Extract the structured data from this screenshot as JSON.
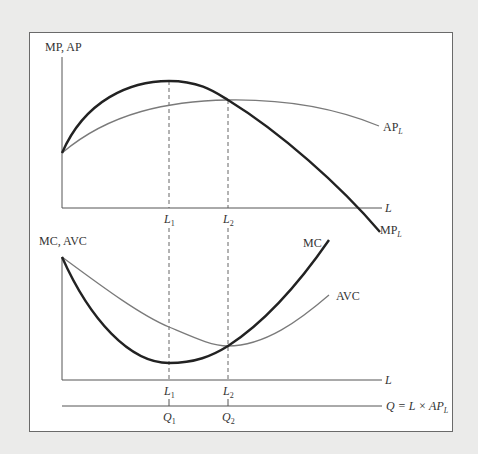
{
  "top_panel": {
    "y_axis_label": "MP, AP",
    "x_axis_label": "L",
    "curves": {
      "mp": {
        "label": "MP",
        "subscript": "L"
      },
      "ap": {
        "label": "AP",
        "subscript": "L"
      }
    },
    "ticks": [
      {
        "label": "L",
        "subscript": "1"
      },
      {
        "label": "L",
        "subscript": "2"
      }
    ]
  },
  "bottom_panel": {
    "y_axis_label": "MC, AVC",
    "x_axis_label": "L",
    "q_axis_label": "Q = L × AP",
    "q_axis_subscript": "L",
    "curves": {
      "mc": {
        "label": "MC"
      },
      "avc": {
        "label": "AVC"
      }
    },
    "l_ticks": [
      {
        "label": "L",
        "subscript": "1"
      },
      {
        "label": "L",
        "subscript": "2"
      }
    ],
    "q_ticks": [
      {
        "label": "Q",
        "subscript": "1"
      },
      {
        "label": "Q",
        "subscript": "2"
      }
    ]
  },
  "colors": {
    "bold_curve": "#222222",
    "thin_curve": "#7a7a7a",
    "axis": "#555555",
    "background": "#ebebea"
  }
}
